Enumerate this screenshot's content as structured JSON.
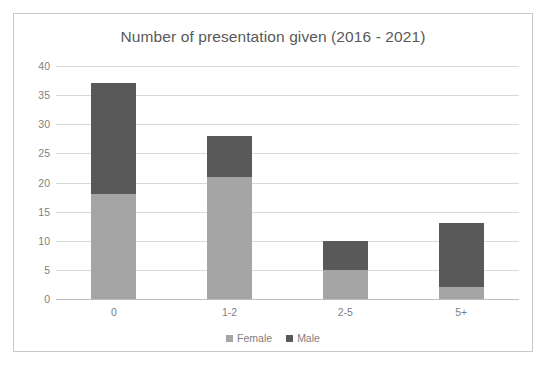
{
  "chart_data": {
    "type": "bar",
    "subtype": "stacked-column",
    "title": "Number of presentation given (2016 - 2021)",
    "xlabel": "",
    "ylabel": "",
    "categories": [
      "0",
      "1-2",
      "2-5",
      "5+"
    ],
    "series": [
      {
        "name": "Female",
        "color": "#a5a5a5",
        "values": [
          18,
          21,
          5,
          2
        ]
      },
      {
        "name": "Male",
        "color": "#595959",
        "values": [
          19,
          7,
          5,
          11
        ]
      }
    ],
    "totals": [
      37,
      28,
      10,
      13
    ],
    "ylim": [
      0,
      40
    ],
    "ytick_step": 5,
    "ytick_labels": [
      "0",
      "5",
      "10",
      "15",
      "20",
      "25",
      "30",
      "35",
      "40"
    ],
    "grid": true,
    "grid_axis": "y",
    "legend_position": "bottom",
    "legend_entries": [
      "Female",
      "Male"
    ],
    "border": true
  },
  "colors": {
    "female": "#a5a5a5",
    "male": "#595959",
    "grid": "#d9d9d9",
    "axis": "#bfbfbf",
    "text": "#7f7f7f",
    "title": "#595959",
    "frame": "#c8c8c8",
    "background": "#ffffff"
  }
}
